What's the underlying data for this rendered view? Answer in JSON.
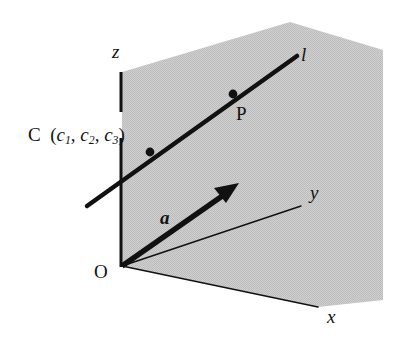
{
  "figure": {
    "background_color": "#ffffff",
    "ink_color": "#111111",
    "plane_fill_color": "#c9c9c9"
  },
  "labels": {
    "z_axis": "z",
    "y_axis": "y",
    "x_axis": "x",
    "origin": "O",
    "line": "l",
    "point_p": "P",
    "point_c": "C",
    "point_c_open_paren": "(",
    "point_c_coord1": "c",
    "point_c_sub1": "1",
    "point_c_comma1": ",",
    "point_c_coord2": "c",
    "point_c_sub2": "2",
    "point_c_comma2": ",",
    "point_c_coord3": "c",
    "point_c_sub3": "3",
    "point_c_close_paren": ")",
    "vector_a": "a"
  },
  "geometry": {
    "origin": [
      122,
      266
    ],
    "z_axis_top": [
      121,
      72
    ],
    "z_axis_gap_top": [
      121,
      112
    ],
    "z_axis_gap_bottom": [
      121,
      138
    ],
    "y_axis_end": [
      301,
      206
    ],
    "x_axis_end": [
      318,
      307
    ],
    "line_l_start": [
      87,
      206
    ],
    "line_l_end": [
      297,
      56
    ],
    "point_c": [
      150,
      152
    ],
    "point_p": [
      233,
      94
    ],
    "vector_a_tip": [
      237,
      184
    ],
    "plane_polygon": [
      [
        122,
        72
      ],
      [
        290,
        22
      ],
      [
        383,
        50
      ],
      [
        383,
        300
      ],
      [
        318,
        307
      ],
      [
        122,
        266
      ]
    ]
  }
}
